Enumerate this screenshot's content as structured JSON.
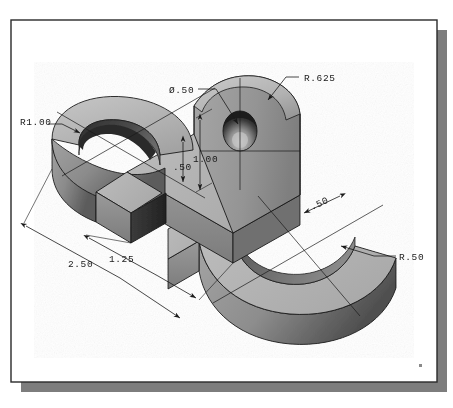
{
  "sheet": {
    "background_color": "#ffffff",
    "border_color": "#2a2a2a",
    "shadow_color": "#7d7d7d",
    "corner_mark": "·"
  },
  "drawing": {
    "title": "Isometric Pictorial — S-shaped Plate with Boss",
    "projection": "isometric",
    "units": "inches",
    "part_color_top": "#b5b5b5",
    "part_color_front": "#8f8f8f",
    "part_color_side": "#6e6e6e",
    "part_color_dark": "#3a3a3a",
    "line_color": "#1a1a1a"
  },
  "dimensions": [
    {
      "id": "r1-00",
      "label": "R1.00",
      "type": "radius-leader",
      "x": 20,
      "y": 121
    },
    {
      "id": "dia-50",
      "label": "Ø.50",
      "type": "diameter-leader",
      "x": 169,
      "y": 92
    },
    {
      "id": "r-625",
      "label": "R.625",
      "type": "radius-leader",
      "x": 303,
      "y": 80
    },
    {
      "id": "h-1-00",
      "label": "1.00",
      "type": "linear-vertical",
      "x": 194,
      "y": 157
    },
    {
      "id": "h-50",
      "label": ".50",
      "type": "linear-vertical",
      "x": 178,
      "y": 166
    },
    {
      "id": "t-50",
      "label": ".50",
      "type": "linear-oblique",
      "x": 318,
      "y": 207
    },
    {
      "id": "w-1-25",
      "label": "1.25",
      "type": "linear-oblique",
      "x": 113,
      "y": 259
    },
    {
      "id": "w-2-50",
      "label": "2.50",
      "type": "linear-oblique",
      "x": 72,
      "y": 264
    },
    {
      "id": "r-50",
      "label": "R.50",
      "type": "radius-leader",
      "x": 400,
      "y": 259
    }
  ]
}
